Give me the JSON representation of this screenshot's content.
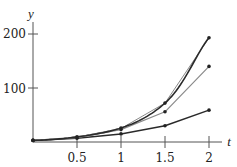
{
  "chart_data": {
    "type": "line",
    "title": "",
    "xlabel": "t",
    "ylabel": "y",
    "xlim": [
      0,
      2.2
    ],
    "ylim": [
      0,
      220
    ],
    "grid": false,
    "legend": "none",
    "x_ticks": [
      0.5,
      1,
      1.5,
      2
    ],
    "x_tick_labels": [
      "0.5",
      "1",
      "1.5",
      "2"
    ],
    "y_ticks": [
      100,
      200
    ],
    "y_tick_labels": [
      "100",
      "200"
    ],
    "x": [
      0,
      0.5,
      1,
      1.5,
      2
    ],
    "series": [
      {
        "name": "exact solution (smooth curve)",
        "style": "dark-thick-curve",
        "values": [
          3,
          9.5,
          26,
          72,
          193
        ]
      },
      {
        "name": "approximation 1",
        "style": "gray-thin-polyline",
        "values": [
          3,
          9,
          25,
          72,
          193
        ]
      },
      {
        "name": "approximation 2",
        "style": "gray-polyline",
        "values": [
          3,
          8,
          23,
          56,
          140
        ]
      },
      {
        "name": "approximation 3",
        "style": "dark-polyline",
        "values": [
          3,
          7,
          15,
          30,
          59
        ]
      }
    ]
  },
  "labels": {
    "x_axis": "t",
    "y_axis": "y",
    "x_ticks": [
      "0.5",
      "1",
      "1.5",
      "2"
    ],
    "y_ticks": [
      "100",
      "200"
    ]
  },
  "colors": {
    "dark": "#2a2a2a",
    "gray": "#8a8a8a",
    "axis": "#555555"
  }
}
